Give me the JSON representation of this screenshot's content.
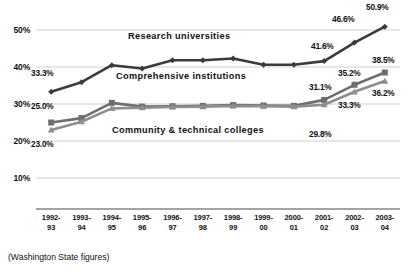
{
  "footnote": "(Washington State figures)",
  "series_labels": {
    "research": "Research universities",
    "comprehensive": "Comprehensive institutions",
    "community": "Community & technical colleges"
  },
  "colors": {
    "research": "#3b3b3b",
    "comprehensive": "#6e6e6e",
    "community": "#8e8e8e",
    "gridline": "#c9c9c9",
    "axis": "#4a4a4a",
    "text": "#111111"
  },
  "chart_data": {
    "type": "line",
    "title": "",
    "xlabel": "",
    "ylabel": "",
    "ylim": [
      5,
      55
    ],
    "yticks": [
      10,
      20,
      30,
      40,
      50
    ],
    "ytick_labels": [
      "10%",
      "20%",
      "30%",
      "40%",
      "50%"
    ],
    "grid": true,
    "legend": "inline-annotations",
    "categories": [
      "1992-93",
      "1993-94",
      "1994-95",
      "1995-96",
      "1996-97",
      "1997-98",
      "1998-99",
      "1999-00",
      "2000-01",
      "2001-02",
      "2002-03",
      "2003-04"
    ],
    "category_lines": [
      [
        "1992-",
        "93"
      ],
      [
        "1993-",
        "94"
      ],
      [
        "1994-",
        "95"
      ],
      [
        "1995-",
        "96"
      ],
      [
        "1996-",
        "97"
      ],
      [
        "1997-",
        "98"
      ],
      [
        "1998-",
        "99"
      ],
      [
        "1999-",
        "00"
      ],
      [
        "2000-",
        "01"
      ],
      [
        "2001-",
        "02"
      ],
      [
        "2002-",
        "03"
      ],
      [
        "2003-",
        "04"
      ]
    ],
    "series": [
      {
        "name": "Research universities",
        "marker": "diamond",
        "color": "#3b3b3b",
        "values": [
          33.3,
          35.9,
          40.5,
          39.6,
          41.8,
          41.8,
          42.3,
          40.6,
          40.6,
          41.6,
          46.6,
          50.9
        ]
      },
      {
        "name": "Comprehensive institutions",
        "marker": "square",
        "color": "#6e6e6e",
        "values": [
          25.0,
          26.2,
          30.3,
          29.3,
          29.4,
          29.5,
          29.7,
          29.6,
          29.5,
          31.1,
          35.2,
          38.5
        ]
      },
      {
        "name": "Community & technical colleges",
        "marker": "triangle",
        "color": "#8e8e8e",
        "values": [
          23.0,
          25.2,
          28.8,
          29.0,
          29.2,
          29.3,
          29.5,
          29.4,
          29.3,
          29.8,
          33.3,
          36.2
        ]
      }
    ],
    "point_labels": [
      {
        "text": "33.3%",
        "series": "Research universities",
        "index": 0
      },
      {
        "text": "41.6%",
        "series": "Research universities",
        "index": 9
      },
      {
        "text": "46.6%",
        "series": "Research universities",
        "index": 10
      },
      {
        "text": "50.9%",
        "series": "Research universities",
        "index": 11
      },
      {
        "text": "25.0%",
        "series": "Comprehensive institutions",
        "index": 0
      },
      {
        "text": "31.1%",
        "series": "Comprehensive institutions",
        "index": 9
      },
      {
        "text": "35.2%",
        "series": "Comprehensive institutions",
        "index": 10
      },
      {
        "text": "38.5%",
        "series": "Comprehensive institutions",
        "index": 11
      },
      {
        "text": "23.0%",
        "series": "Community & technical colleges",
        "index": 0
      },
      {
        "text": "29.8%",
        "series": "Community & technical colleges",
        "index": 9
      },
      {
        "text": "33.3%",
        "series": "Community & technical colleges",
        "index": 10
      },
      {
        "text": "36.2%",
        "series": "Community & technical colleges",
        "index": 11
      }
    ]
  },
  "annotations": {
    "label_positions": [
      {
        "key": "33.3%",
        "x": 31,
        "y": 68
      },
      {
        "key": "25.0%",
        "x": 31,
        "y": 101
      },
      {
        "key": "23.0%",
        "x": 31,
        "y": 139
      },
      {
        "key": "41.6%",
        "x": 311,
        "y": 41
      },
      {
        "key": "46.6%",
        "x": 332,
        "y": 14
      },
      {
        "key": "50.9%",
        "x": 366,
        "y": 2
      },
      {
        "key": "31.1%",
        "x": 309,
        "y": 82
      },
      {
        "key": "35.2%",
        "x": 338,
        "y": 68
      },
      {
        "key": "38.5%",
        "x": 372,
        "y": 55
      },
      {
        "key": "29.8%",
        "x": 309,
        "y": 129
      },
      {
        "key": "33.3%b",
        "x": 338,
        "y": 100
      },
      {
        "key": "36.2%",
        "x": 372,
        "y": 88
      }
    ]
  }
}
